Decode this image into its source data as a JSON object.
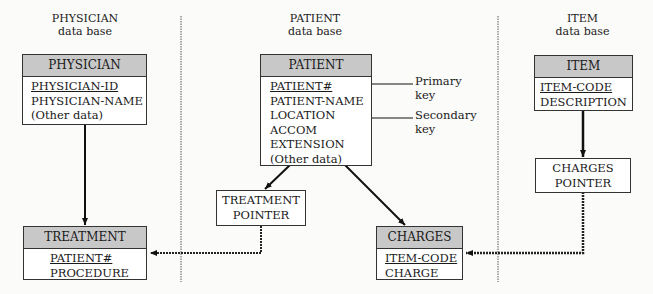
{
  "sections": [
    {
      "title": "PHYSICIAN",
      "subtitle": "data base"
    },
    {
      "title": "PATIENT",
      "subtitle": "data base"
    },
    {
      "title": "ITEM",
      "subtitle": "data base"
    }
  ],
  "entities": {
    "physician": {
      "header": "PHYSICIAN",
      "fields": [
        "PHYSICIAN-ID",
        "PHYSICIAN-NAME",
        "(Other data)"
      ],
      "key_field": "PHYSICIAN-ID"
    },
    "patient": {
      "header": "PATIENT",
      "fields": [
        "PATIENT#",
        "PATIENT-NAME",
        "LOCATION",
        "ACCOM",
        "EXTENSION",
        "(Other data)"
      ],
      "key_field": "PATIENT#"
    },
    "item": {
      "header": "ITEM",
      "fields": [
        "ITEM-CODE",
        "DESCRIPTION"
      ],
      "key_field": "ITEM-CODE"
    },
    "treatment": {
      "header": "TREATMENT",
      "fields": [
        "PATIENT#",
        "PROCEDURE"
      ],
      "key_field": "PATIENT#"
    },
    "charges": {
      "header": "CHARGES",
      "fields": [
        "ITEM-CODE",
        "CHARGE"
      ],
      "key_field": "ITEM-CODE"
    }
  },
  "pointers": {
    "treatment_pointer": [
      "TREATMENT",
      "POINTER"
    ],
    "charges_pointer": [
      "CHARGES",
      "POINTER"
    ]
  },
  "annotations": {
    "primary_key": [
      "Primary",
      "key"
    ],
    "secondary_key": [
      "Secondary",
      "key"
    ]
  }
}
